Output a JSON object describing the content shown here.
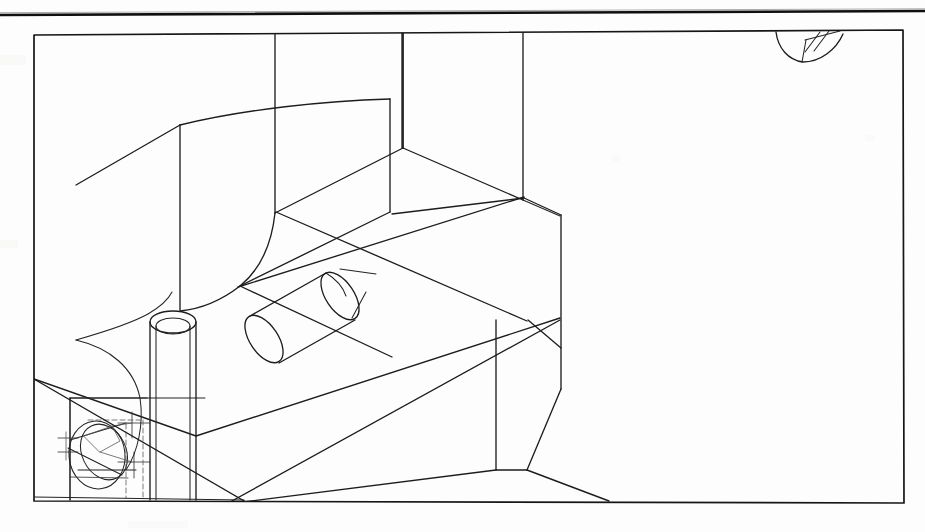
{
  "document": {
    "kind": "scanned-technical-drawing",
    "title": "Isometric Wireframe Part Drawing",
    "sheet_width": 925,
    "sheet_height": 532,
    "background_color": "#fefefe",
    "ink_color": "#1a1a1a",
    "has_text_labels": false,
    "notes": "No dimension text, annotations or title-block text is legible in this scan."
  },
  "header_rule": {
    "name": "top-border-rule",
    "description": "Heavy horizontal rule spanning the full sheet width, slightly tilted upward to the right (scan skew).",
    "x1": 0,
    "y1": 15,
    "x2": 925,
    "y2": 11,
    "stroke_width": 2.6,
    "color": "#0f0f0f"
  },
  "frame": {
    "name": "drawing-frame",
    "description": "Rectangular border of the drawing field, skewed slightly by the scan.",
    "corners": {
      "top_left": [
        34,
        35
      ],
      "top_right": [
        903,
        30
      ],
      "bottom_right": [
        904,
        503
      ],
      "bottom_left": [
        34,
        501
      ]
    },
    "stroke_width": 1.7,
    "color": "#161616"
  },
  "geometry": {
    "description": "Wireframe isometric projection of a machined block with a swept fillet surface, two cylindrical bosses and a counterbored hole detail at lower left.",
    "features": [
      {
        "id": "vertical-pipe",
        "name": "vertical-cylinder-boss",
        "type": "cylinder",
        "orientation": "vertical",
        "top_ellipse_center": [
          173,
          321
        ],
        "top_ellipse_rx": 23,
        "top_ellipse_ry": 11,
        "height": 175
      },
      {
        "id": "diagonal-pipe",
        "name": "diagonal-cylinder-boss",
        "type": "cylinder",
        "orientation": "oblique",
        "axis_start": [
          268,
          345
        ],
        "axis_end": [
          340,
          296
        ],
        "radius": 31
      },
      {
        "id": "top-hole",
        "name": "partial-hole-at-top-edge",
        "type": "partial-cylinder",
        "center": [
          805,
          36
        ],
        "width": 62,
        "depth": 26
      },
      {
        "id": "corner-detail",
        "name": "counterbore-detail",
        "type": "hidden-detail-cluster",
        "bounds": [
          60,
          398,
          145,
          105
        ],
        "description": "Dense cluster of hidden (dashed) edges, centre-lines and an inclined bore ellipse in the lower-left corner."
      },
      {
        "id": "swept-face",
        "name": "swept-fillet-surface",
        "type": "ruled-surface",
        "description": "Large tangent-swept surface running from the upper-left silhouette down to the lower-left region."
      },
      {
        "id": "faceted-block",
        "name": "faceted-prism-body",
        "type": "polyhedron",
        "description": "Chamfered prismatic body occupying the centre and right of the field."
      }
    ],
    "construction_lines": [
      {
        "name": "long-diagonal-upper",
        "from": [
          80,
          182
        ],
        "to": [
          523,
          36
        ]
      },
      {
        "name": "long-diagonal-lower",
        "from": [
          36,
          380
        ],
        "to": [
          527,
          501
        ]
      },
      {
        "name": "long-diagonal-cross",
        "from": [
          243,
          502
        ],
        "to": [
          560,
          318
        ]
      }
    ]
  },
  "palette": {
    "paper": "#fefefe",
    "ink": "#1a1a1a",
    "light_ink": "#3a3a3a",
    "ghost_ink": "#585858"
  }
}
